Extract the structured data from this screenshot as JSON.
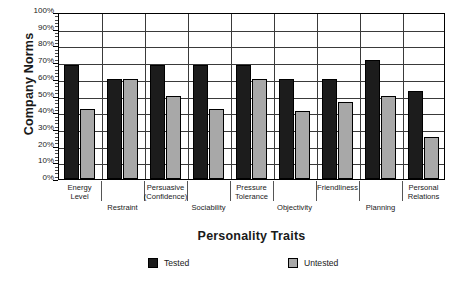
{
  "chart_data": {
    "type": "bar",
    "title": "",
    "xlabel": "Personality Traits",
    "ylabel": "Company Norms",
    "ylim": [
      0,
      100
    ],
    "ytick_labels": [
      "100%",
      "90%",
      "80%",
      "70%",
      "60%",
      "50%",
      "40%",
      "30%",
      "20%",
      "10%",
      "0%"
    ],
    "ytick_values": [
      100,
      90,
      80,
      70,
      60,
      50,
      40,
      30,
      20,
      10,
      0
    ],
    "grid": true,
    "legend_position": "bottom",
    "categories": [
      "Energy\nLevel",
      "Restraint",
      "Persuasive\n(Confidence)",
      "Sociability",
      "Pressure\nTolerance",
      "Objectivity",
      "Friendliness",
      "Planning",
      "Personal\nRelations"
    ],
    "series": [
      {
        "name": "Tested",
        "color": "#1c1c1c",
        "values": [
          68,
          60,
          68,
          68,
          68,
          60,
          60,
          71,
          53
        ]
      },
      {
        "name": "Untested",
        "color": "#a8a8a8",
        "values": [
          42,
          60,
          50,
          42,
          60,
          41,
          46,
          50,
          25
        ]
      }
    ]
  },
  "legend": {
    "items": [
      {
        "label": "Tested"
      },
      {
        "label": "Untested"
      }
    ]
  },
  "axis_titles": {
    "y": "Company Norms",
    "x": "Personality Traits"
  }
}
